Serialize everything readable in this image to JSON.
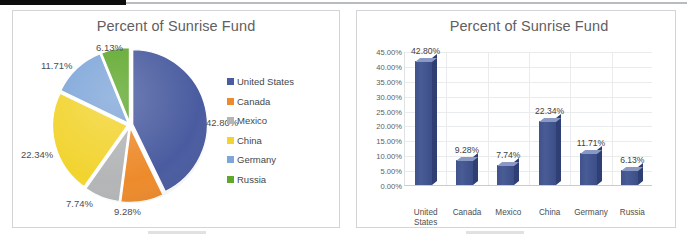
{
  "chart_data": [
    {
      "type": "pie",
      "title": "Percent of Sunrise Fund",
      "categories": [
        "United States",
        "Canada",
        "Mexico",
        "China",
        "Germany",
        "Russia"
      ],
      "values": [
        42.8,
        9.28,
        7.74,
        22.34,
        11.71,
        6.13
      ],
      "value_labels": [
        "42.80%",
        "9.28%",
        "7.74%",
        "22.34%",
        "11.71%",
        "6.13%"
      ],
      "colors": [
        "#4a5ca0",
        "#ed8b2c",
        "#b3b5b7",
        "#f2d430",
        "#7fa6d9",
        "#5fa82c"
      ],
      "legend_position": "right",
      "grid": false,
      "xlabel": "",
      "ylabel": ""
    },
    {
      "type": "bar",
      "title": "Percent of Sunrise Fund",
      "categories": [
        "United\nStates",
        "Canada",
        "Mexico",
        "China",
        "Germany",
        "Russia"
      ],
      "values": [
        42.8,
        9.28,
        7.74,
        22.34,
        11.71,
        6.13
      ],
      "value_labels": [
        "42.80%",
        "9.28%",
        "7.74%",
        "22.34%",
        "11.71%",
        "6.13%"
      ],
      "ylim": [
        0,
        45
      ],
      "yticks": [
        "0.00%",
        "5.00%",
        "10.00%",
        "15.00%",
        "20.00%",
        "25.00%",
        "30.00%",
        "35.00%",
        "40.00%",
        "45.00%"
      ],
      "ytick_values": [
        0,
        5,
        10,
        15,
        20,
        25,
        30,
        35,
        40,
        45
      ],
      "grid": true,
      "legend_position": "none",
      "series_color": "#42538e",
      "xlabel": "",
      "ylabel": ""
    }
  ],
  "pie_chart": {
    "title": "Percent of Sunrise Fund",
    "legend": [
      {
        "label": "United States",
        "color": "#4a5ca0"
      },
      {
        "label": "Canada",
        "color": "#ed8b2c"
      },
      {
        "label": "Mexico",
        "color": "#b3b5b7"
      },
      {
        "label": "China",
        "color": "#f2d430"
      },
      {
        "label": "Germany",
        "color": "#7fa6d9"
      },
      {
        "label": "Russia",
        "color": "#5fa82c"
      }
    ],
    "labels": [
      {
        "text": "42.80%"
      },
      {
        "text": "9.28%"
      },
      {
        "text": "7.74%"
      },
      {
        "text": "22.34%"
      },
      {
        "text": "11.71%"
      },
      {
        "text": "6.13%"
      }
    ]
  },
  "bar_chart": {
    "title": "Percent of Sunrise Fund",
    "yticks": [
      "45.00%",
      "40.00%",
      "35.00%",
      "30.00%",
      "25.00%",
      "20.00%",
      "15.00%",
      "10.00%",
      "5.00%",
      "0.00%"
    ],
    "bars": [
      {
        "category": "United\nStates",
        "value": 42.8,
        "label": "42.80%"
      },
      {
        "category": "Canada",
        "value": 9.28,
        "label": "9.28%"
      },
      {
        "category": "Mexico",
        "value": 7.74,
        "label": "7.74%"
      },
      {
        "category": "China",
        "value": 22.34,
        "label": "22.34%"
      },
      {
        "category": "Germany",
        "value": 11.71,
        "label": "11.71%"
      },
      {
        "category": "Russia",
        "value": 6.13,
        "label": "6.13%"
      }
    ]
  }
}
